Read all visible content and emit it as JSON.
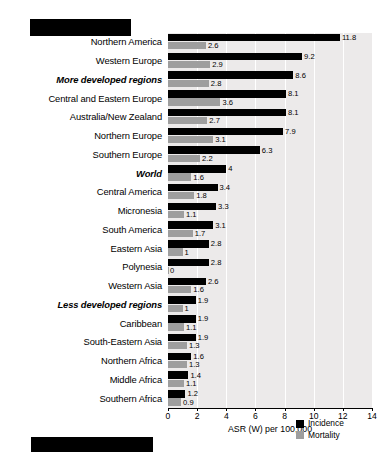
{
  "chart_data": {
    "type": "bar",
    "orientation": "horizontal",
    "title": "",
    "xlabel": "ASR (W) per 100,000",
    "ylabel": "",
    "xlim": [
      0,
      14
    ],
    "xticks": [
      0,
      2,
      4,
      6,
      8,
      10,
      12,
      14
    ],
    "grid": true,
    "legend_position": "bottom-right",
    "categories": [
      "Northern America",
      "Western Europe",
      "More developed regions",
      "Central and Eastern Europe",
      "Australia/New Zealand",
      "Northern Europe",
      "Southern Europe",
      "World",
      "Central America",
      "Micronesia",
      "South America",
      "Eastern Asia",
      "Polynesia",
      "Western Asia",
      "Less developed regions",
      "Caribbean",
      "South-Eastern Asia",
      "Northern Africa",
      "Middle Africa",
      "Southern Africa"
    ],
    "emphasized_categories": [
      "More developed regions",
      "World",
      "Less developed regions"
    ],
    "series": [
      {
        "name": "Incidence",
        "color": "#000000",
        "values": [
          11.8,
          9.2,
          8.6,
          8.1,
          8.1,
          7.9,
          6.3,
          4,
          3.4,
          3.3,
          3.1,
          2.8,
          2.8,
          2.6,
          1.9,
          1.9,
          1.9,
          1.6,
          1.4,
          1.2
        ],
        "labels": [
          "11.8",
          "9.2",
          "8.6",
          "8.1",
          "8.1",
          "7.9",
          "6.3",
          "4",
          "3.4",
          "3.3",
          "3.1",
          "2.8",
          "2.8",
          "2.6",
          "1.9",
          "1.9",
          "1.9",
          "1.6",
          "1.4",
          "1.2"
        ]
      },
      {
        "name": "Mortality",
        "color": "#9e9e9e",
        "values": [
          2.6,
          2.9,
          2.8,
          3.6,
          2.7,
          3.1,
          2.2,
          1.6,
          1.8,
          1.1,
          1.7,
          1,
          0,
          1.6,
          1,
          1.1,
          1.3,
          1.3,
          1.1,
          0.9
        ],
        "labels": [
          "2.6",
          "2.9",
          "2.8",
          "3.6",
          "2.7",
          "3.1",
          "2.2",
          "1.6",
          "1.8",
          "1.1",
          "1.7",
          "1",
          "0",
          "1.6",
          "1",
          "1.1",
          "1.3",
          "1.3",
          "1.1",
          "0.9"
        ]
      }
    ]
  },
  "legend": {
    "items": [
      {
        "label": "Incidence",
        "color": "#000000"
      },
      {
        "label": "Mortality",
        "color": "#9e9e9e"
      }
    ]
  },
  "axis": {
    "x_title": "ASR (W) per 100,000",
    "tick_labels": [
      "0",
      "2",
      "4",
      "6",
      "8",
      "10",
      "12",
      "14"
    ]
  },
  "redactions": [
    {
      "name": "top-redaction-block"
    },
    {
      "name": "bottom-redaction-block"
    }
  ]
}
